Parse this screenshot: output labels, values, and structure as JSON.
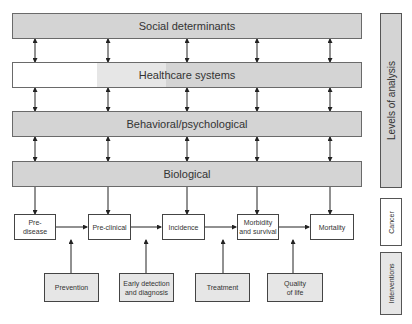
{
  "levels": [
    {
      "label": "Social determinants"
    },
    {
      "label": "Healthcare systems"
    },
    {
      "label": "Behavioral/psychological"
    },
    {
      "label": "Biological"
    }
  ],
  "stages": [
    {
      "label": "Pre-\ndisease"
    },
    {
      "label": "Pre-clinical"
    },
    {
      "label": "Incidence"
    },
    {
      "label": "Morbidity\nand survival"
    },
    {
      "label": "Mortality"
    }
  ],
  "interventions": [
    {
      "label": "Prevention"
    },
    {
      "label": "Early detection\nand diagnosis"
    },
    {
      "label": "Treatment"
    },
    {
      "label": "Quality\nof life"
    }
  ],
  "side_labels": {
    "levels": "Levels of analysis",
    "cancer": "Cancer",
    "interventions": "Interventions"
  },
  "colors": {
    "level_fill": "#d4d4d4",
    "intervention_fill": "#e6e6e6",
    "stage_fill": "#ffffff",
    "line": "#333333"
  }
}
